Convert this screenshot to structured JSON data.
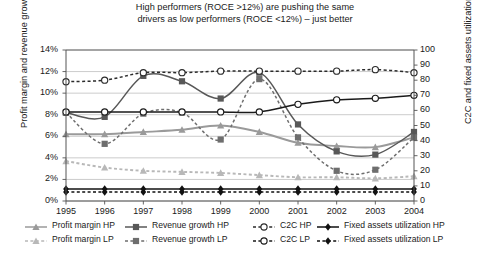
{
  "chart_data": {
    "type": "line",
    "title": "High performers (ROCE >12%) are pushing the same drivers as low performers (ROCE <12%) – just better",
    "title_line1": "High performers (ROCE >12%) are pushing the same",
    "title_line2": "drivers as low performers (ROCE <12%) – just better",
    "xlabel": "",
    "ylabel": "Profit margin and revenue growth",
    "ylabel_right": "C2C and fixed assets utilization",
    "x": [
      "1995",
      "1996",
      "1997",
      "1998",
      "1999",
      "2000",
      "2001",
      "2002",
      "2003",
      "2004"
    ],
    "categories": [
      "1995",
      "1996",
      "1997",
      "1998",
      "1999",
      "2000",
      "2001",
      "2002",
      "2003",
      "2004"
    ],
    "ylim": [
      0,
      14
    ],
    "ylim_right": [
      0,
      100
    ],
    "yticks": [
      "0%",
      "2%",
      "4%",
      "6%",
      "8%",
      "10%",
      "12%",
      "14%"
    ],
    "yticks_right": [
      "0",
      "10",
      "20",
      "30",
      "40",
      "50",
      "60",
      "70",
      "80",
      "90",
      "100"
    ],
    "grid": true,
    "legend_position": "bottom",
    "series": [
      {
        "name": "Profit margin HP",
        "axis": "left",
        "marker": "triangle",
        "style": "solid",
        "color": "#9a9a9a",
        "values": [
          6.2,
          6.2,
          6.4,
          6.6,
          7.0,
          6.4,
          5.4,
          5.1,
          5.0,
          5.9
        ]
      },
      {
        "name": "Profit margin LP",
        "axis": "left",
        "marker": "triangle",
        "style": "dashed",
        "color": "#b8b8b8",
        "values": [
          3.7,
          3.1,
          2.8,
          2.7,
          2.6,
          2.4,
          2.2,
          2.2,
          2.1,
          2.3
        ]
      },
      {
        "name": "Revenue growth HP",
        "axis": "left",
        "marker": "square",
        "style": "solid",
        "color": "#585858",
        "values": [
          8.2,
          7.8,
          11.6,
          11.1,
          9.5,
          11.9,
          7.1,
          4.6,
          4.3,
          6.4
        ]
      },
      {
        "name": "Revenue growth LP",
        "axis": "left",
        "marker": "square",
        "style": "dashed",
        "color": "#6e6e6e",
        "values": [
          8.2,
          5.3,
          8.1,
          8.2,
          5.7,
          11.3,
          5.9,
          2.8,
          2.9,
          5.9
        ]
      },
      {
        "name": "C2C HP",
        "axis": "right",
        "marker": "circle-open",
        "style": "dashed",
        "color": "#2b2b2b",
        "values": [
          79,
          80,
          85,
          85,
          86,
          86,
          86,
          86,
          87,
          85
        ]
      },
      {
        "name": "C2C LP",
        "axis": "right",
        "marker": "circle-open",
        "style": "solid",
        "color": "#1a1a1a",
        "values": [
          59,
          59,
          59,
          59,
          59,
          59,
          64,
          67,
          68,
          70
        ]
      },
      {
        "name": "Fixed assets utilization HP",
        "axis": "right",
        "marker": "diamond",
        "style": "solid",
        "color": "#111111",
        "values": [
          8,
          8,
          8,
          8,
          8,
          8,
          8,
          8,
          8,
          8
        ]
      },
      {
        "name": "Fixed assets utilization LP",
        "axis": "right",
        "marker": "diamond",
        "style": "dashed",
        "color": "#111111",
        "values": [
          6,
          6,
          6,
          6,
          6,
          6,
          6,
          6,
          6,
          6
        ]
      }
    ]
  },
  "legend": [
    {
      "label": "Profit margin HP",
      "marker": "triangle",
      "style": "solid",
      "color": "#9a9a9a"
    },
    {
      "label": "Revenue growth HP",
      "marker": "square",
      "style": "solid",
      "color": "#585858"
    },
    {
      "label": "C2C HP",
      "marker": "circle-open",
      "style": "dashed",
      "color": "#2b2b2b"
    },
    {
      "label": "Fixed assets utilization HP",
      "marker": "diamond",
      "style": "solid",
      "color": "#111111"
    },
    {
      "label": "Profit margin LP",
      "marker": "triangle",
      "style": "dashed",
      "color": "#b8b8b8"
    },
    {
      "label": "Revenue growth LP",
      "marker": "square",
      "style": "dashed",
      "color": "#6e6e6e"
    },
    {
      "label": "C2C LP",
      "marker": "circle-open",
      "style": "dashed",
      "color": "#1a1a1a"
    },
    {
      "label": "Fixed assets utilization LP",
      "marker": "diamond",
      "style": "dashed",
      "color": "#111111"
    }
  ]
}
